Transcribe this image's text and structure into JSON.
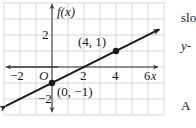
{
  "chart_data": {
    "type": "line",
    "title": "",
    "xlabel": "x",
    "ylabel": "f(x)",
    "xlim": [
      -3,
      6.7
    ],
    "ylim": [
      -3,
      4
    ],
    "grid": true,
    "x_ticks": [
      {
        "value": -2,
        "label": "−2"
      },
      {
        "value": 2,
        "label": "2"
      },
      {
        "value": 4,
        "label": "4"
      },
      {
        "value": 6,
        "label": "6"
      }
    ],
    "y_ticks": [
      {
        "value": 2,
        "label": "2"
      },
      {
        "value": -2,
        "label": "−2"
      }
    ],
    "origin_label": "O",
    "series": [
      {
        "name": "f(x)",
        "slope": 0.5,
        "intercept": -1,
        "x": [
          -2.9,
          6.7
        ],
        "y": [
          -2.45,
          2.35
        ],
        "color": "#1a1a1a"
      }
    ],
    "points": [
      {
        "x": 0,
        "y": -1,
        "label": "(0, −1)"
      },
      {
        "x": 4,
        "y": 1,
        "label": "(4, 1)"
      }
    ]
  },
  "side_text": {
    "line1": "slo",
    "line2": "y-",
    "line3": "A"
  }
}
